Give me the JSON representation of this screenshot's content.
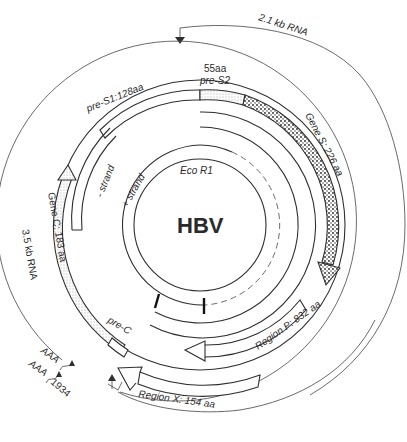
{
  "diagram": {
    "title": "HBV",
    "center_label_restriction_site": "Eco R1",
    "strands": {
      "minus": "- strand",
      "plus": "+ strand"
    },
    "transcripts": {
      "rna_2_1kb": "2.1 kb  RNA",
      "rna_3_5kb": "3.5 kb  RNA",
      "polyA_1": "AAA",
      "polyA_2": "AAA",
      "position": "1934"
    },
    "genes": {
      "pre_s1": "pre-S1:128aa",
      "pre_s2_size": "55aa",
      "pre_s2": "pre-S2",
      "gene_s": "Gene S: 226 aa",
      "gene_c": "Gene C: 183 aa",
      "pre_c": "pre-C",
      "region_p": "Region P: 832 aa",
      "region_x": "Region X: 154 aa"
    },
    "colors": {
      "line": "#2f2f2f",
      "background": "#ffffff",
      "stipple": "#333333"
    }
  }
}
